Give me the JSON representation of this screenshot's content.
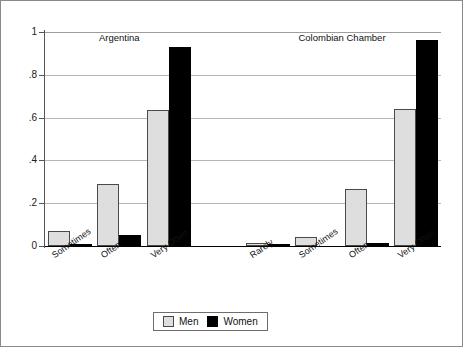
{
  "chart_data": {
    "type": "bar",
    "title": "",
    "xlabel": "",
    "ylabel": "",
    "ylim": [
      0,
      1
    ],
    "ytick_labels": [
      "1",
      ".8",
      ".6",
      ".4",
      ".2",
      "0"
    ],
    "ytick_values": [
      1,
      0.8,
      0.6,
      0.4,
      0.2,
      0
    ],
    "grid": true,
    "legend_position": "bottom-center",
    "legend": [
      "Men",
      "Women"
    ],
    "colors": {
      "men": "#dedede",
      "women": "#000000",
      "gridline": "#b6b6b6",
      "axis": "#555555"
    },
    "groups": [
      {
        "name": "Argentina",
        "categories": [
          "Sometimes",
          "Often",
          "Very Often"
        ],
        "series": [
          {
            "name": "Men",
            "values": [
              0.07,
              0.29,
              0.635
            ]
          },
          {
            "name": "Women",
            "values": [
              0.007,
              0.05,
              0.93
            ]
          }
        ]
      },
      {
        "name": "Colombian Chamber",
        "categories": [
          "Rarely",
          "Sometimes",
          "Often",
          "Very Often"
        ],
        "series": [
          {
            "name": "Men",
            "values": [
              0.015,
              0.04,
              0.265,
              0.64
            ]
          },
          {
            "name": "Women",
            "values": [
              0.002,
              0.0,
              0.015,
              0.965
            ]
          }
        ]
      }
    ]
  },
  "legend": {
    "men_label": "Men",
    "women_label": "Women"
  }
}
